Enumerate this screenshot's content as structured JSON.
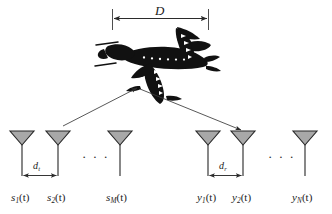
{
  "figure": {
    "aperture_label": "D",
    "spacing_tx_label": "d",
    "spacing_tx_sub": "t",
    "spacing_rx_label": "d",
    "spacing_rx_sub": "r",
    "ellipsis": "· · ·",
    "colors": {
      "antenna_fill": "#a8a8a8",
      "antenna_stroke": "#262626",
      "line": "#333333",
      "aircraft": "#111111",
      "text": "#1b1b1b",
      "background": "#ffffff"
    }
  },
  "aircraft": {
    "name": "airplane-silhouette",
    "caption": ""
  },
  "transmit_array": {
    "name": "transmit-antenna-array",
    "antennas": [
      {
        "id": "tx1",
        "base": "s",
        "sub": "1",
        "arg": "(t)",
        "label": "s1(t)",
        "x": 22
      },
      {
        "id": "tx2",
        "base": "s",
        "sub": "2",
        "arg": "(t)",
        "label": "s2(t)",
        "x": 58
      },
      {
        "id": "txM",
        "base": "s",
        "sub": "M",
        "arg": "(t)",
        "label": "sM(t)",
        "x": 120
      }
    ]
  },
  "receive_array": {
    "name": "receive-antenna-array",
    "antennas": [
      {
        "id": "rx1",
        "base": "y",
        "sub": "1",
        "arg": "(t)",
        "label": "y1(t)",
        "x": 208
      },
      {
        "id": "rx2",
        "base": "y",
        "sub": "2",
        "arg": "(t)",
        "label": "y2(t)",
        "x": 243
      },
      {
        "id": "rxN",
        "base": "y",
        "sub": "N",
        "arg": "(t)",
        "label": "yN(t)",
        "x": 305
      }
    ]
  },
  "paths": [
    {
      "name": "uplink-path-to-aircraft",
      "from": "tx2",
      "to": "aircraft"
    },
    {
      "name": "downlink-path-to-rx2",
      "from": "aircraft",
      "to": "rx2"
    }
  ]
}
